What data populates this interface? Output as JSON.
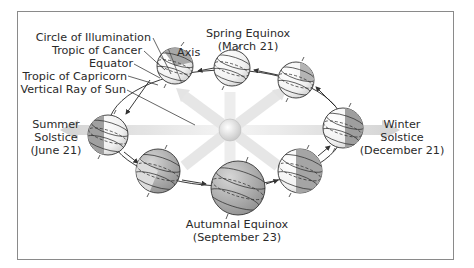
{
  "diagram": {
    "labels": {
      "circle_of_illumination": "Circle of Illumination",
      "tropic_of_cancer": "Tropic of Cancer",
      "equator": "Equator",
      "tropic_of_capricorn": "Tropic of Capricorn",
      "vertical_ray": "Vertical Ray of Sun",
      "axis": "Axis"
    },
    "seasons": {
      "spring": {
        "line1": "Spring Equinox",
        "line2": "(March 21)"
      },
      "summer": {
        "line1": "Summer",
        "line2": "Solstice",
        "line3": "(June 21)"
      },
      "autumn": {
        "line1": "Autumnal Equinox",
        "line2": "(September 23)"
      },
      "winter": {
        "line1": "Winter",
        "line2": "Solstice",
        "line3": "(December 21)"
      }
    },
    "colors": {
      "frame": "#8a8a8a",
      "globe_light": "#ffffff",
      "globe_dark": "#9a9a9a",
      "ray": "#d9d9d9",
      "text": "#2a2a2a"
    }
  }
}
